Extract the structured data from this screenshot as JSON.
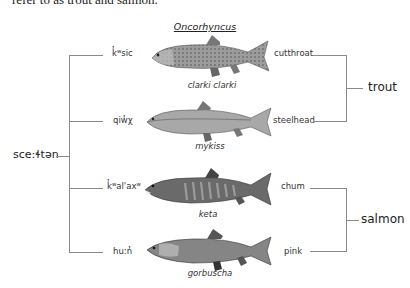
{
  "intro_text": "refer to as trout and salmon.",
  "genus": "Oncorhyncus",
  "root_label": "sce:ɬtən",
  "fish": [
    {
      "indigenous": "k̓ʷsic",
      "species": "clarki clarki",
      "common": "cutthroat",
      "style": "spotted",
      "color": "#8f8f8f"
    },
    {
      "indigenous": "qiw̓χ",
      "species": "mykiss",
      "common": "steelhead",
      "style": "plain",
      "color": "#9a9a9a"
    },
    {
      "indigenous": "k̓ʷal'axʷ",
      "species": "keta",
      "common": "chum",
      "style": "barred",
      "color": "#555555"
    },
    {
      "indigenous": "hu:n̓",
      "species": "gorbuscha",
      "common": "pink",
      "style": "plain-dark",
      "color": "#7d7d7d"
    }
  ],
  "groups": {
    "trout": "trout",
    "salmon": "salmon"
  },
  "colors": {
    "line": "#8a8a8a",
    "text": "#222222"
  }
}
